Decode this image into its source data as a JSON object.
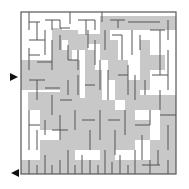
{
  "puzzle": {
    "type": "maze",
    "bounds": {
      "x": 21,
      "y": 12,
      "width": 155,
      "height": 162
    },
    "colors": {
      "background": "#ffffff",
      "wall": "#555555",
      "solution_fill": "#c8c8c8",
      "arrow": "#111111"
    },
    "entrance_arrow": {
      "direction": "right",
      "x": 10,
      "y": 77
    },
    "exit_arrow": {
      "direction": "left",
      "x": 11,
      "y": 173
    }
  }
}
